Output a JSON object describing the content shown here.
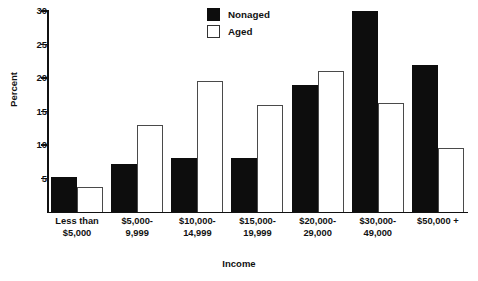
{
  "chart_data": {
    "type": "bar",
    "title": "",
    "xlabel": "Income",
    "ylabel": "Percent",
    "ylim": [
      0,
      30
    ],
    "yticks": [
      0,
      5,
      10,
      15,
      20,
      25,
      30
    ],
    "ytick_labels": [
      "",
      "5",
      "10",
      "15",
      "20",
      "25",
      "30"
    ],
    "grid": false,
    "legend_position": "top-center",
    "categories": [
      "Less than\n$5,000",
      "$5,000-\n9,999",
      "$10,000-\n14,999",
      "$15,000-\n19,999",
      "$20,000-\n29,000",
      "$30,000-\n49,000",
      "$50,000 +"
    ],
    "category_lines": [
      [
        "Less than",
        "$5,000"
      ],
      [
        "$5,000-",
        "9,999"
      ],
      [
        "$10,000-",
        "14,999"
      ],
      [
        "$15,000-",
        "19,999"
      ],
      [
        "$20,000-",
        "29,000"
      ],
      [
        "$30,000-",
        "49,000"
      ],
      [
        "$50,000 +",
        ""
      ]
    ],
    "series": [
      {
        "name": "Nonaged",
        "color": "#0d0d0d",
        "style": "filled",
        "values": [
          5.2,
          7.2,
          8.0,
          8.0,
          19.0,
          30.0,
          22.0
        ]
      },
      {
        "name": "Aged",
        "color": "#ffffff",
        "style": "outlined",
        "values": [
          3.7,
          13.0,
          19.6,
          16.0,
          21.0,
          16.3,
          9.5
        ]
      }
    ]
  },
  "legend": {
    "items": [
      {
        "label": "Nonaged",
        "swatch": "filled-black-square"
      },
      {
        "label": "Aged",
        "swatch": "outlined-white-square"
      }
    ]
  },
  "colors": {
    "bar_filled": "#0d0d0d",
    "bar_outline": "#4a4a4a",
    "axis": "#111111",
    "background": "#ffffff"
  }
}
